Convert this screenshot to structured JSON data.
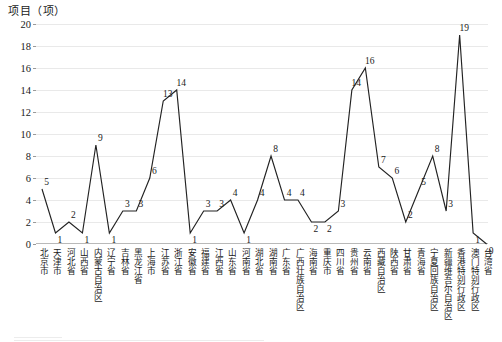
{
  "chart_data": {
    "type": "line",
    "title": "",
    "ylabel": "项目（项）",
    "xlabel": "",
    "ylim": [
      0,
      20
    ],
    "ytick_step": 2,
    "yticks": [
      0,
      2,
      4,
      6,
      8,
      10,
      12,
      14,
      16,
      18,
      20
    ],
    "grid": true,
    "legend": null,
    "show_data_labels": true,
    "line_color": "#222222",
    "grid_color": "#e9e9e9",
    "categories": [
      "北京市",
      "天津市",
      "河北省",
      "山西省",
      "内蒙古自治区",
      "辽宁省",
      "吉林省",
      "黑龙江省",
      "上海市",
      "江苏省",
      "浙江省",
      "安徽省",
      "福建省",
      "江西省",
      "山东省",
      "河南省",
      "湖北省",
      "湖南省",
      "广东省",
      "广西壮族自治区",
      "海南省",
      "重庆市",
      "四川省",
      "贵州省",
      "云南省",
      "西藏自治区",
      "陕西省",
      "甘肃省",
      "青海省",
      "宁夏回族自治区",
      "新疆维吾尔自治区",
      "香港特别行政区",
      "澳门特别行政区",
      "台湾省"
    ],
    "values": [
      5,
      1,
      2,
      1,
      9,
      1,
      3,
      3,
      6,
      13,
      14,
      1,
      3,
      3,
      4,
      1,
      4,
      8,
      4,
      4,
      2,
      2,
      3,
      14,
      16,
      7,
      6,
      2,
      5,
      8,
      3,
      19,
      1,
      0
    ],
    "point_labels": [
      "5",
      "1",
      "2",
      "1",
      "9",
      "1",
      "3",
      "3",
      "6",
      "13",
      "14",
      "1",
      "3",
      "3",
      "4",
      "1",
      "4",
      "8",
      "4",
      "4",
      "2",
      "2",
      "3",
      "14",
      "16",
      "7",
      "6",
      "2",
      "5",
      "8",
      "3",
      "19",
      "1",
      "0"
    ],
    "extra_end_label": "0"
  }
}
